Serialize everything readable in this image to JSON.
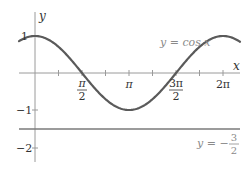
{
  "chart_data": {
    "type": "line",
    "title": "",
    "xlabel": "x",
    "ylabel": "y",
    "xlim": [
      -0.53,
      6.8
    ],
    "ylim": [
      -2.4,
      1.35
    ],
    "grid": false,
    "series": [
      {
        "name": "y = cos x",
        "function": "cos(x)",
        "x": [
          -0.5,
          0,
          0.785,
          1.571,
          2.356,
          3.142,
          3.927,
          4.712,
          5.498,
          6.283,
          6.8
        ],
        "values": [
          0.878,
          1,
          0.707,
          0,
          -0.707,
          -1,
          -0.707,
          0,
          0.707,
          1,
          0.869
        ],
        "color": "#5a5a5a"
      },
      {
        "name": "y = -3/2",
        "function": "-1.5",
        "x": [
          -0.53,
          6.8
        ],
        "values": [
          -1.5,
          -1.5
        ],
        "color": "#7a7a7a"
      }
    ],
    "x_ticks": [
      {
        "value": 1.5708,
        "label_num": "π",
        "label_den": "2"
      },
      {
        "value": 3.1416,
        "label": "π"
      },
      {
        "value": 4.7124,
        "label_num": "3π",
        "label_den": "2"
      },
      {
        "value": 6.2832,
        "label": "2π"
      }
    ],
    "y_ticks": [
      {
        "value": 1,
        "label": "1"
      },
      {
        "value": -1,
        "label": "−1"
      },
      {
        "value": -2,
        "label": "−2"
      }
    ],
    "annotations": [
      {
        "text": "y = cos x",
        "near": "curve peak at 2π"
      },
      {
        "text": "y = −3/2",
        "near": "horizontal line, right"
      }
    ]
  },
  "labels": {
    "x_axis": "x",
    "y_axis": "y",
    "curve_label": "y = cos x",
    "line_label_prefix": "y = −",
    "line_label_num": "3",
    "line_label_den": "2",
    "tick_pi_half_num": "π",
    "tick_pi_half_den": "2",
    "tick_pi": "π",
    "tick_3pi_half_num": "3π",
    "tick_3pi_half_den": "2",
    "tick_2pi": "2π",
    "ytick_1": "1",
    "ytick_m1": "−1",
    "ytick_m2": "−2"
  }
}
